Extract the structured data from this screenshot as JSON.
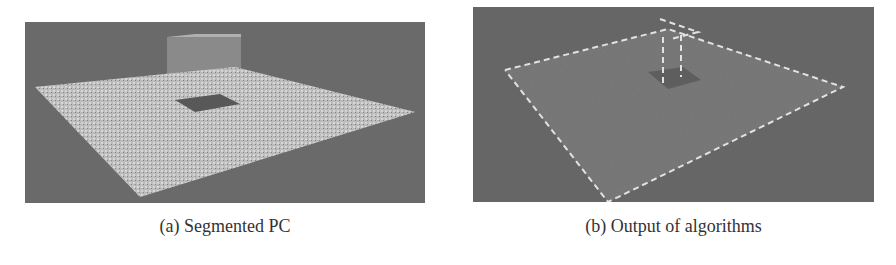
{
  "figure": {
    "subfigures": [
      {
        "id": "a",
        "caption": "(a) Segmented PC",
        "content": "point-cloud rendering of a speckled plane with a raised box and a dark square hole",
        "colors": {
          "background": "#6e6e6e",
          "plane": "#bdbdbd",
          "hole": "#555555",
          "box": "#9a9a9a"
        }
      },
      {
        "id": "b",
        "caption": "(b) Output of algorithms",
        "content": "detected plane outline drawn with dashed light lines over gray point cloud, with vertical dashed box edges",
        "colors": {
          "background": "#686868",
          "plane": "#7c7c7c",
          "outline": "#e0e0e0",
          "hole": "#5c5c5c"
        }
      }
    ]
  }
}
